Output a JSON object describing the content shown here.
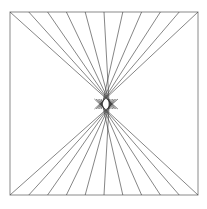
{
  "diagram": {
    "type": "string-art-hourglass",
    "background": "#ffffff",
    "frame": {
      "x1": 10,
      "y1": 12,
      "x2": 198,
      "y2": 195,
      "color": "#8a8a8a"
    },
    "line_color": "#333333",
    "points_per_edge": 11,
    "top_edge_x": [
      10,
      28.8,
      47.6,
      66.4,
      85.2,
      104,
      122.8,
      141.6,
      160.4,
      179.2,
      198
    ],
    "bottom_edge_x": [
      10,
      28.8,
      47.6,
      66.4,
      85.2,
      104,
      122.8,
      141.6,
      160.4,
      179.2,
      198
    ],
    "top_focus_left": {
      "x": 103,
      "y": 109
    },
    "top_focus_right": {
      "x": 109,
      "y": 109
    },
    "bottom_focus_left": {
      "x": 103,
      "y": 99
    },
    "bottom_focus_right": {
      "x": 109,
      "y": 99
    },
    "center_gap": {
      "x": 106,
      "y": 104
    }
  }
}
